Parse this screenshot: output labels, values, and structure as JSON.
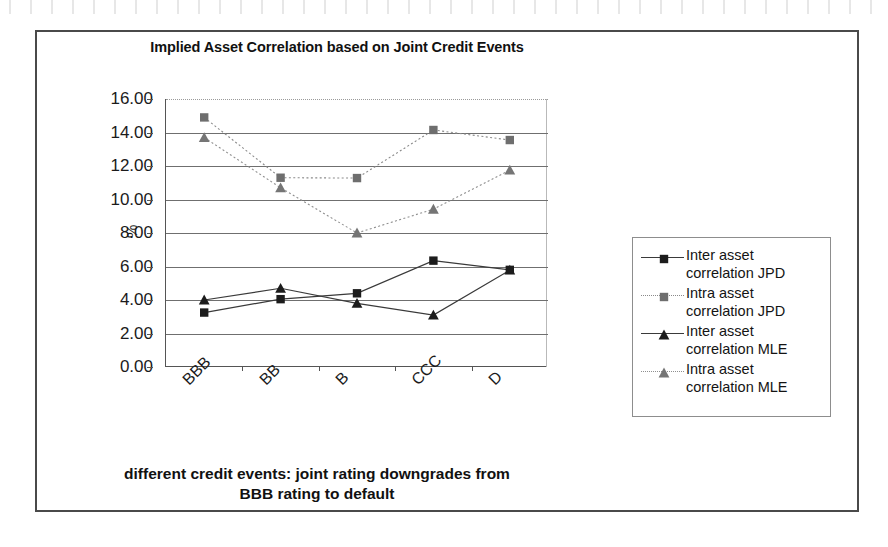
{
  "chart_data": {
    "type": "line",
    "title": "Implied Asset Correlation based on Joint Credit Events",
    "xlabel": "different credit events: joint rating downgrades from BBB rating to default",
    "xlabel_line1": "different credit events: joint rating downgrades from",
    "xlabel_line2": "BBB rating to default",
    "ylabel": "%",
    "categories": [
      "BBB",
      "BB",
      "B",
      "CCC",
      "D"
    ],
    "ylim": [
      0.0,
      16.0
    ],
    "ytick_step": 2.0,
    "yticks": [
      "0.00",
      "2.00",
      "4.00",
      "6.00",
      "8.00",
      "10.00",
      "12.00",
      "14.00",
      "16.00"
    ],
    "ytick_values": [
      0.0,
      2.0,
      4.0,
      6.0,
      8.0,
      10.0,
      12.0,
      14.0,
      16.0
    ],
    "grid": true,
    "legend_position": "right",
    "series": [
      {
        "name": "Inter asset correlation JPD",
        "label_line1": "Inter asset",
        "label_line2": "correlation JPD",
        "marker": "square",
        "marker_color": "#1c1c1c",
        "line_style": "solid",
        "line_color": "#3a3a3a",
        "values": [
          3.25,
          4.05,
          4.4,
          6.35,
          5.8
        ]
      },
      {
        "name": "Intra asset correlation JPD",
        "label_line1": "Intra asset",
        "label_line2": "correlation JPD",
        "marker": "square",
        "marker_color": "#6e6e6e",
        "line_style": "dotted",
        "line_color": "#8a8a8a",
        "values": [
          14.9,
          11.3,
          11.28,
          14.15,
          13.55
        ]
      },
      {
        "name": "Inter asset correlation MLE",
        "label_line1": "Inter asset",
        "label_line2": "correlation MLE",
        "marker": "triangle",
        "marker_color": "#1c1c1c",
        "line_style": "solid",
        "line_color": "#3a3a3a",
        "values": [
          4.0,
          4.7,
          3.8,
          3.1,
          5.78
        ]
      },
      {
        "name": "Intra asset correlation MLE",
        "label_line1": "Intra asset",
        "label_line2": "correlation MLE",
        "marker": "triangle",
        "marker_color": "#757575",
        "line_style": "dotted",
        "line_color": "#8f8f8f",
        "values": [
          13.7,
          10.7,
          8.0,
          9.42,
          11.75
        ]
      }
    ]
  }
}
